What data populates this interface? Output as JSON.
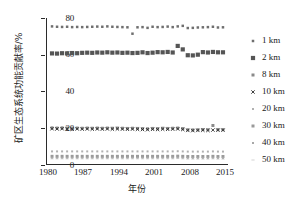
{
  "chart_data": {
    "type": "scatter",
    "title": "",
    "xlabel": "年份",
    "ylabel": "矿区生态系统功能贡献率/%",
    "xlim": [
      1980,
      2016
    ],
    "ylim": [
      0,
      80
    ],
    "xticks": [
      "1980",
      "1987",
      "1994",
      "2001",
      "2008",
      "2015"
    ],
    "xtick_values": [
      1980,
      1987,
      1994,
      2001,
      2008,
      2015
    ],
    "yticks": [
      "0",
      "20",
      "40",
      "60",
      "80"
    ],
    "ytick_values": [
      0,
      20,
      40,
      60,
      80
    ],
    "grid": false,
    "legend_position": "right",
    "x": [
      1981,
      1982,
      1983,
      1984,
      1985,
      1986,
      1987,
      1988,
      1989,
      1990,
      1991,
      1992,
      1993,
      1994,
      1995,
      1996,
      1997,
      1998,
      1999,
      2000,
      2001,
      2002,
      2003,
      2004,
      2005,
      2006,
      2007,
      2008,
      2009,
      2010,
      2011,
      2012,
      2013,
      2014,
      2015
    ],
    "series": [
      {
        "name": "1 km",
        "color": "#6f6f6f",
        "marker": "dot-small",
        "values": [
          75.4,
          75.2,
          75.1,
          75.2,
          75.0,
          75.1,
          75.0,
          75.1,
          75.2,
          75.3,
          75.2,
          75.4,
          75.2,
          75.1,
          75.0,
          74.9,
          71.4,
          74.9,
          75.0,
          74.6,
          75.2,
          75.0,
          75.1,
          75.3,
          75.0,
          75.4,
          75.7,
          74.5,
          74.6,
          74.8,
          74.9,
          75.0,
          75.2,
          74.8,
          74.9
        ]
      },
      {
        "name": "2 km",
        "color": "#555555",
        "marker": "square",
        "values": [
          60.6,
          60.5,
          60.7,
          60.6,
          60.8,
          60.7,
          60.9,
          61.0,
          60.9,
          61.1,
          61.0,
          61.2,
          61.0,
          61.1,
          60.9,
          61.0,
          60.8,
          60.9,
          61.2,
          60.8,
          61.0,
          61.3,
          61.2,
          61.4,
          61.1,
          64.7,
          62.8,
          59.6,
          59.5,
          59.9,
          61.3,
          61.1,
          61.4,
          61.2,
          61.2
        ]
      },
      {
        "name": "8 km",
        "color": "#8a8a8a",
        "marker": "dot",
        "values": [
          19.8,
          19.7,
          19.8,
          19.7,
          19.6,
          19.7,
          19.6,
          19.7,
          19.6,
          19.7,
          19.6,
          19.7,
          19.6,
          19.7,
          19.6,
          19.5,
          19.6,
          19.5,
          19.4,
          19.3,
          19.5,
          19.4,
          19.6,
          19.5,
          19.6,
          19.7,
          19.4,
          18.8,
          18.7,
          18.8,
          18.9,
          18.8,
          21.1,
          18.9,
          18.9
        ]
      },
      {
        "name": "10 km",
        "color": "#2b2b2b",
        "marker": "cross",
        "values": [
          19.3,
          19.2,
          19.3,
          19.2,
          19.1,
          19.2,
          19.1,
          19.2,
          19.1,
          19.2,
          19.1,
          19.2,
          19.1,
          19.2,
          19.1,
          19.0,
          19.1,
          19.0,
          18.9,
          18.8,
          19.0,
          18.9,
          19.1,
          19.0,
          19.1,
          19.2,
          18.9,
          18.4,
          18.3,
          18.4,
          18.5,
          18.4,
          18.6,
          18.5,
          18.5
        ]
      },
      {
        "name": "20 km",
        "color": "#b0b0b0",
        "marker": "dot-tiny",
        "values": [
          6.9,
          6.9,
          6.9,
          6.9,
          6.9,
          6.9,
          6.9,
          6.9,
          6.9,
          6.9,
          6.9,
          6.9,
          6.9,
          6.9,
          6.9,
          6.9,
          6.9,
          6.9,
          6.9,
          6.9,
          6.9,
          6.9,
          6.9,
          6.9,
          6.9,
          7.0,
          6.9,
          6.8,
          6.8,
          6.8,
          6.8,
          6.8,
          6.9,
          6.8,
          6.8
        ]
      },
      {
        "name": "30 km",
        "color": "#9a9a9a",
        "marker": "dot",
        "values": [
          4.2,
          4.2,
          4.2,
          4.2,
          4.2,
          4.2,
          4.2,
          4.2,
          4.2,
          4.2,
          4.2,
          4.2,
          4.2,
          4.2,
          4.2,
          4.2,
          4.2,
          4.2,
          4.2,
          4.2,
          4.2,
          4.2,
          4.2,
          4.2,
          4.2,
          4.3,
          4.2,
          4.1,
          4.1,
          4.1,
          4.1,
          4.1,
          4.2,
          4.1,
          4.1
        ]
      },
      {
        "name": "40 km",
        "color": "#a8a8a8",
        "marker": "dot-tiny",
        "values": [
          3.4,
          3.4,
          3.4,
          3.4,
          3.4,
          3.4,
          3.4,
          3.4,
          3.4,
          3.4,
          3.4,
          3.4,
          3.4,
          3.4,
          3.4,
          3.4,
          3.4,
          3.4,
          3.4,
          3.4,
          3.4,
          3.4,
          3.4,
          3.4,
          3.4,
          3.5,
          3.4,
          3.3,
          3.3,
          3.3,
          3.3,
          3.3,
          3.4,
          3.3,
          3.3
        ]
      },
      {
        "name": "50 km",
        "color": "#c0c0c0",
        "marker": "dash",
        "values": [
          2.8,
          2.8,
          2.8,
          2.8,
          2.8,
          2.8,
          2.8,
          2.8,
          2.8,
          2.8,
          2.8,
          2.8,
          2.8,
          2.8,
          2.8,
          2.8,
          2.8,
          2.8,
          2.8,
          2.8,
          2.8,
          2.8,
          2.8,
          2.8,
          2.8,
          2.9,
          2.8,
          2.7,
          2.7,
          2.7,
          2.7,
          2.7,
          2.8,
          2.7,
          2.7
        ]
      }
    ]
  },
  "axes": {
    "ylabel": "矿区生态系统功能贡献率/%",
    "xlabel": "年份",
    "yticks": [
      "80",
      "60",
      "40",
      "20",
      "0"
    ],
    "xticks": [
      "1980",
      "1987",
      "1994",
      "2001",
      "2008",
      "2015"
    ]
  },
  "legend": {
    "items": [
      {
        "label": "1 km"
      },
      {
        "label": "2 km"
      },
      {
        "label": "8 km"
      },
      {
        "label": "10 km"
      },
      {
        "label": "20 km"
      },
      {
        "label": "30 km"
      },
      {
        "label": "40 km"
      },
      {
        "label": "50 km"
      }
    ]
  },
  "colors": {
    "axis": "#2b2b2b",
    "background": "#ffffff",
    "text": "#1a1a1a"
  }
}
